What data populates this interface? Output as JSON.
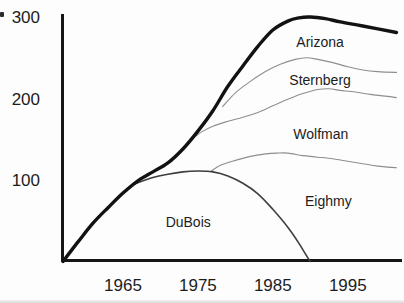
{
  "figure": {
    "kind": "scanned line chart of population estimates",
    "background_color": "#fdfdfd",
    "text_color": "#1c1c1c",
    "axis_color": "#161616"
  },
  "chart_data": {
    "type": "line",
    "title": "",
    "xlabel": "",
    "ylabel": "",
    "grid": false,
    "legend_position": "labels-inline-below-each-curve",
    "x_axis": {
      "min": 1957,
      "max": 2002.3,
      "ticks": [
        1965,
        1975,
        1985,
        1995
      ],
      "tick_labels": [
        "1965",
        "1975",
        "1985",
        "1995"
      ]
    },
    "y_axis": {
      "min": 0,
      "max": 300,
      "ticks": [
        100,
        200,
        300
      ],
      "tick_labels": [
        "100",
        "200",
        "300"
      ]
    },
    "series": [
      {
        "name": "Arizona",
        "color": "#121212",
        "width": 3.4,
        "label_pos": {
          "year": 1991.3,
          "value": 269
        },
        "points": [
          [
            1957,
            0
          ],
          [
            1959,
            24
          ],
          [
            1961,
            47
          ],
          [
            1963,
            66
          ],
          [
            1965,
            84
          ],
          [
            1967,
            99
          ],
          [
            1969,
            110
          ],
          [
            1971,
            121
          ],
          [
            1973,
            138
          ],
          [
            1975,
            160
          ],
          [
            1977,
            185
          ],
          [
            1979,
            215
          ],
          [
            1981,
            240
          ],
          [
            1983,
            264
          ],
          [
            1985,
            284
          ],
          [
            1987,
            295
          ],
          [
            1988.5,
            299
          ],
          [
            1990,
            300
          ],
          [
            1992,
            298
          ],
          [
            1994,
            294
          ],
          [
            1997,
            289
          ],
          [
            2001.5,
            281
          ]
        ]
      },
      {
        "name": "Sternberg",
        "color": "#8e8e8e",
        "width": 1.1,
        "label_pos": {
          "year": 1991.3,
          "value": 223
        },
        "points": [
          [
            1978.3,
            190
          ],
          [
            1980,
            207
          ],
          [
            1982,
            221
          ],
          [
            1984,
            233
          ],
          [
            1986,
            242
          ],
          [
            1988,
            248
          ],
          [
            1989.5,
            250
          ],
          [
            1991,
            248
          ],
          [
            1993,
            244
          ],
          [
            1995,
            239
          ],
          [
            1997,
            235
          ],
          [
            1999,
            233
          ],
          [
            2001.5,
            232
          ]
        ]
      },
      {
        "name": "Wolfman",
        "color": "#8e8e8e",
        "width": 1.1,
        "label_pos": {
          "year": 1991.4,
          "value": 157
        },
        "points": [
          [
            1973.9,
            148
          ],
          [
            1975.5,
            159
          ],
          [
            1977,
            166
          ],
          [
            1979,
            172
          ],
          [
            1981,
            177
          ],
          [
            1983,
            183
          ],
          [
            1985,
            191
          ],
          [
            1987,
            199
          ],
          [
            1989,
            206
          ],
          [
            1991,
            211
          ],
          [
            1992.5,
            212
          ],
          [
            1994,
            210
          ],
          [
            1996,
            208
          ],
          [
            1998,
            205
          ],
          [
            2000,
            203
          ],
          [
            2001.5,
            201
          ]
        ]
      },
      {
        "name": "Eighmy",
        "color": "#8e8e8e",
        "width": 1.1,
        "label_pos": {
          "year": 1992.4,
          "value": 74
        },
        "points": [
          [
            1976.8,
            111
          ],
          [
            1978,
            118
          ],
          [
            1980,
            124
          ],
          [
            1982,
            129
          ],
          [
            1984,
            132
          ],
          [
            1985.5,
            133
          ],
          [
            1987,
            133
          ],
          [
            1989,
            130
          ],
          [
            1991,
            128
          ],
          [
            1993,
            126
          ],
          [
            1995,
            123
          ],
          [
            1997,
            120
          ],
          [
            1999,
            117
          ],
          [
            2001.5,
            115
          ]
        ]
      },
      {
        "name": "DuBois",
        "color": "#3e3e3e",
        "width": 1.6,
        "label_pos": {
          "year": 1973.7,
          "value": 48
        },
        "points": [
          [
            1966.5,
            95
          ],
          [
            1969,
            103
          ],
          [
            1971,
            107
          ],
          [
            1973,
            110
          ],
          [
            1975,
            111
          ],
          [
            1977,
            110
          ],
          [
            1979,
            105
          ],
          [
            1981,
            96
          ],
          [
            1983,
            83
          ],
          [
            1985,
            64
          ],
          [
            1987,
            42
          ],
          [
            1988.5,
            22
          ],
          [
            1989.5,
            7
          ],
          [
            1990,
            0
          ]
        ]
      }
    ]
  }
}
